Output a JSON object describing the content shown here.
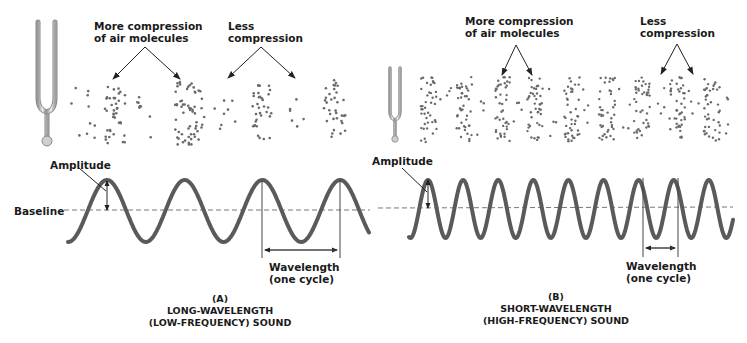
{
  "panels": [
    {
      "id": "A",
      "compression_label": "More compression\nof air molecules",
      "rarefaction_label": "Less\ncompression",
      "amplitude_label": "Amplitude",
      "baseline_label": "Baseline",
      "wavelength_label": "Wavelength\n(one cycle)",
      "caption_letter": "(A)",
      "caption_line1": "LONG-WAVELENGTH",
      "caption_line2": "(LOW-FREQUENCY) SOUND"
    },
    {
      "id": "B",
      "compression_label": "More compression\nof air molecules",
      "rarefaction_label": "Less\ncompression",
      "amplitude_label": "Amplitude",
      "wavelength_label": "Wavelength\n(one cycle)",
      "caption_letter": "(B)",
      "caption_line1": "SHORT-WAVELENGTH",
      "caption_line2": "(HIGH-FREQUENCY) SOUND"
    }
  ],
  "colors": {
    "wave": "#5a5a5a",
    "text": "#1a1a1a",
    "dots": "#6a6a6a",
    "baseline": "#777777",
    "fork": "#b8b8b8"
  }
}
